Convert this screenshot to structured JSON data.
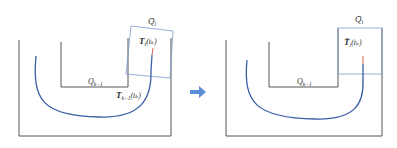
{
  "diagram": {
    "colors": {
      "wall": "#555555",
      "trajectory": "#3a5ea8",
      "region_box": "#7a9ad0",
      "endpoint": "#e06050",
      "arrow": "#5b8ed6"
    },
    "left_panel": {
      "label_region_bar": "Q̄",
      "label_region_bar_sub": "i",
      "label_trajectory_top": "T",
      "label_trajectory_top_sup": "i",
      "label_trajectory_top_sub": "i",
      "label_trajectory_top_arg": "(tₖ)",
      "label_inner": "Q",
      "label_inner_sub": "k−1",
      "label_trajectory_bottom": "T",
      "label_trajectory_bottom_sup": "i",
      "label_trajectory_bottom_sub": "k−1",
      "label_trajectory_bottom_arg": "(tₖ)"
    },
    "transition_arrow": "arrow-right",
    "right_panel": {
      "label_region_bar": "Q̄",
      "label_region_bar_sub": "i",
      "label_trajectory": "T̄",
      "label_trajectory_sup": "k",
      "label_trajectory_sub": "i",
      "label_trajectory_arg": "(tₖ)",
      "label_inner": "Q",
      "label_inner_sub": "k−1"
    }
  }
}
